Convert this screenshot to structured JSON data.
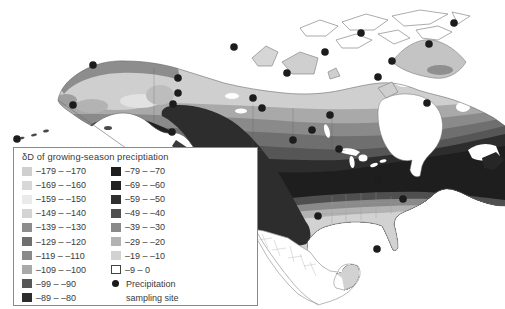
{
  "legend": {
    "title": "δD of growing-season preciptiation",
    "left_entries": [
      {
        "label": "–179 – –170",
        "color": "#cfcfcf"
      },
      {
        "label": "–169 – –160",
        "color": "#d8d8d8"
      },
      {
        "label": "–159 – –150",
        "color": "#eaeaea"
      },
      {
        "label": "–149 – –140",
        "color": "#d4d4d4"
      },
      {
        "label": "–139 – –130",
        "color": "#8d8d8d"
      },
      {
        "label": "–129 – –120",
        "color": "#6f6f6f"
      },
      {
        "label": "–119 – –110",
        "color": "#8a8a8a"
      },
      {
        "label": "–109 – –100",
        "color": "#a9a9a9"
      },
      {
        "label": "–99 – –90",
        "color": "#565656"
      },
      {
        "label": "–89 – –80",
        "color": "#2d2d2d"
      }
    ],
    "right_entries": [
      {
        "label": "–79 – –70",
        "color": "#1e1e1e"
      },
      {
        "label": "–69 – –60",
        "color": "#212121"
      },
      {
        "label": "–59 – –50",
        "color": "#2f2f2f"
      },
      {
        "label": "–49 – –40",
        "color": "#4f4f4f"
      },
      {
        "label": "–39 – –30",
        "color": "#8a8a8a"
      },
      {
        "label": "–29 – –20",
        "color": "#b3b3b3"
      },
      {
        "label": "–19 – –10",
        "color": "#d2d2d2"
      },
      {
        "label": "–9 – 0",
        "color": "#ffffff",
        "outlined": true
      }
    ],
    "site_entry": {
      "line1": "Precipitation",
      "line2": "sampling site",
      "dot_color": "#1a1a1a"
    }
  },
  "map": {
    "background": "#ffffff",
    "coast_outline_color": "#6b6b6b",
    "sampling_site_color": "#1c1c1c",
    "sampling_sites": [
      [
        17,
        139
      ],
      [
        73,
        105
      ],
      [
        93,
        65
      ],
      [
        178,
        78
      ],
      [
        178,
        93
      ],
      [
        173,
        104
      ],
      [
        172,
        132
      ],
      [
        234,
        47
      ],
      [
        253,
        98
      ],
      [
        262,
        108
      ],
      [
        287,
        73
      ],
      [
        312,
        130
      ],
      [
        325,
        52
      ],
      [
        330,
        115
      ],
      [
        361,
        33
      ],
      [
        378,
        77
      ],
      [
        392,
        61
      ],
      [
        427,
        103
      ],
      [
        429,
        44
      ],
      [
        454,
        23
      ],
      [
        293,
        140
      ],
      [
        339,
        149
      ],
      [
        318,
        216
      ],
      [
        378,
        180
      ],
      [
        403,
        199
      ],
      [
        377,
        249
      ]
    ]
  }
}
